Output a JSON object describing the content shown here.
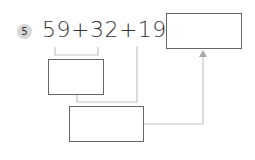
{
  "problem": {
    "number": "5",
    "expression": "59+32+19=",
    "answer_box": "",
    "step1_box": "",
    "step2_box": ""
  },
  "colors": {
    "box_border": "#666666",
    "connector": "#c4c4c4",
    "badge_fill": "#d6d6d6",
    "text": "#333333"
  }
}
